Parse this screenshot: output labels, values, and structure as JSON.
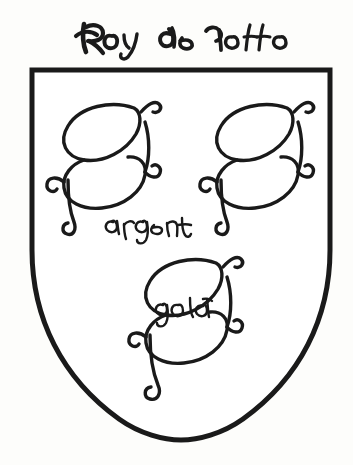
{
  "image": {
    "kind": "heraldic-line-drawing",
    "subject": "coat-of-arms-shield",
    "background_color": "#fdfdfb",
    "ink_color": "#1a1a1a",
    "width": 353,
    "height": 465
  },
  "title": {
    "text": "Roy de Yorsse",
    "words": [
      "Roy",
      "de",
      "Yorsse"
    ],
    "script_style": "medieval-cursive",
    "position": "above-shield"
  },
  "shield": {
    "name": "escutcheon",
    "outline_color": "#1a1a1a",
    "fill_color": "#ffffff",
    "stroke_width": 5,
    "shape": "square-top-rounded-point-base",
    "left": 30,
    "right": 330,
    "top": 68,
    "bottom": 438
  },
  "charges": [
    {
      "id": "charge-s-top-left",
      "glyph": "S",
      "style": "ornate-gothic-letter",
      "position": "dexter-chief",
      "cx": 100,
      "cy": 160
    },
    {
      "id": "charge-s-top-right",
      "glyph": "S",
      "style": "ornate-gothic-letter",
      "position": "sinister-chief",
      "cx": 253,
      "cy": 160
    },
    {
      "id": "charge-s-bottom",
      "glyph": "S",
      "style": "ornate-gothic-letter",
      "position": "base-center",
      "cx": 182,
      "cy": 315
    }
  ],
  "annotations": [
    {
      "id": "annotation-argent",
      "text": "argent",
      "script_style": "handwritten-cursive",
      "x": 140,
      "y": 226,
      "note": "tincture label near dexter-chief charge"
    },
    {
      "id": "annotation-gold",
      "text": "gold",
      "script_style": "handwritten-cursive",
      "x": 178,
      "y": 309,
      "note": "tincture label inside base charge"
    }
  ]
}
